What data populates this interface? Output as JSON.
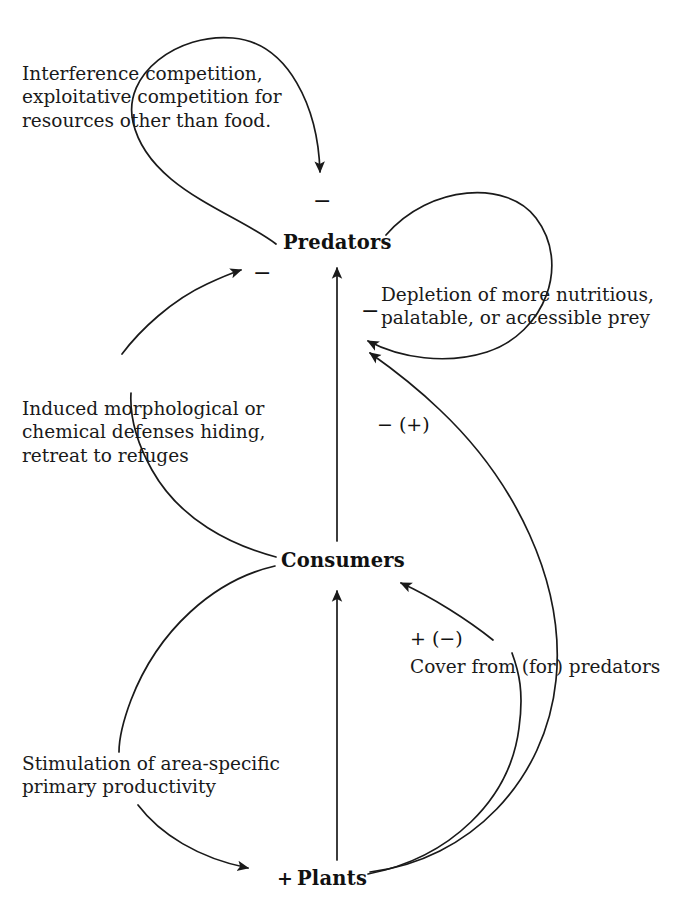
{
  "figure": {
    "type": "causal-loop-diagram",
    "background_color": "#ffffff",
    "line_color": "#1a1a1a"
  },
  "nodes": [
    {
      "id": "predators",
      "label": "Predators",
      "x": 283,
      "y": 233
    },
    {
      "id": "consumers",
      "label": "Consumers",
      "x": 281,
      "y": 551
    },
    {
      "id": "plants",
      "label": "Plants",
      "x": 297,
      "y": 869
    }
  ],
  "captions": [
    {
      "id": "interference",
      "text": "Interference competition,\nexploitative competition for\nresources other than food.",
      "x": 22,
      "y": 62
    },
    {
      "id": "depletion",
      "text": "Depletion of more nutritious,\npalatable, or accessible prey",
      "x": 381,
      "y": 283
    },
    {
      "id": "induced-defenses",
      "text": "Induced morphological or\nchemical defenses hiding,\nretreat to refuges",
      "x": 22,
      "y": 397
    },
    {
      "id": "cover",
      "text": "Cover from (for) predators",
      "x": 410,
      "y": 655
    },
    {
      "id": "stimulation",
      "text": "Stimulation of area-specific\nprimary productivity",
      "x": 22,
      "y": 752
    }
  ],
  "signs": [
    {
      "id": "sign-interference",
      "text": "−",
      "x": 313,
      "y": 190
    },
    {
      "id": "sign-depletion",
      "text": "−",
      "x": 361,
      "y": 300
    },
    {
      "id": "sign-induced",
      "text": "−",
      "x": 253,
      "y": 262
    },
    {
      "id": "sign-plants-to-predators",
      "text": "− (+)",
      "x": 377,
      "y": 413
    },
    {
      "id": "sign-plants-to-consumers",
      "text": "+ (−)",
      "x": 410,
      "y": 627
    },
    {
      "id": "sign-plants-incoming",
      "text": "+",
      "x": 277,
      "y": 860
    }
  ],
  "edges": [
    {
      "id": "predators-self-loop-left",
      "from": "predators",
      "to": "predators",
      "sign": "−",
      "caption": "interference"
    },
    {
      "id": "predators-self-loop-right",
      "from": "predators",
      "to": "predators",
      "sign": "−",
      "caption": "depletion"
    },
    {
      "id": "consumers-to-predators-defenses",
      "from": "consumers",
      "to": "predators",
      "sign": "−",
      "caption": "induced-defenses"
    },
    {
      "id": "consumers-to-predators-direct",
      "from": "consumers",
      "to": "predators",
      "sign": "",
      "caption": ""
    },
    {
      "id": "plants-to-predators",
      "from": "plants",
      "to": "predators",
      "sign": "− (+)",
      "caption": ""
    },
    {
      "id": "plants-to-consumers-cover",
      "from": "plants",
      "to": "consumers",
      "sign": "+ (−)",
      "caption": "cover"
    },
    {
      "id": "plants-to-consumers-direct",
      "from": "plants",
      "to": "consumers",
      "sign": "",
      "caption": ""
    },
    {
      "id": "consumers-to-plants",
      "from": "consumers",
      "to": "plants",
      "sign": "+",
      "caption": "stimulation"
    }
  ]
}
